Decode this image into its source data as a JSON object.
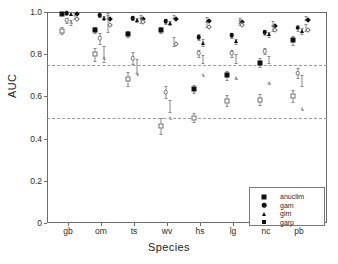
{
  "chart_data": {
    "type": "scatter",
    "title": "",
    "xlabel": "Species",
    "ylabel": "AUC",
    "ylim": [
      0,
      1.0
    ],
    "yticks": [
      "0",
      "0.2",
      "0.4",
      "0.6",
      "0.8",
      "1.0"
    ],
    "ytick_values": [
      0,
      0.2,
      0.4,
      0.6,
      0.8,
      1.0
    ],
    "grid": false,
    "reference_lines": [
      0.75,
      0.5
    ],
    "legend_position": "bottom-right",
    "categories": [
      "gb",
      "om",
      "ts",
      "wv",
      "hs",
      "lg",
      "nc",
      "pb"
    ],
    "series": [
      {
        "name": "anuclim",
        "marker": "square-filled",
        "values": [
          0.99,
          0.915,
          0.895,
          0.915,
          0.635,
          0.7,
          0.76,
          0.865
        ],
        "err_low": [
          0.985,
          0.9,
          0.88,
          0.9,
          0.615,
          0.68,
          0.74,
          0.845
        ],
        "err_high": [
          0.995,
          0.93,
          0.91,
          0.93,
          0.655,
          0.72,
          0.78,
          0.885
        ]
      },
      {
        "name": "gam",
        "marker": "circle-filled",
        "values": [
          0.995,
          0.985,
          0.97,
          0.955,
          0.88,
          0.89,
          0.905,
          0.925
        ],
        "err_low": [
          0.99,
          0.978,
          0.96,
          0.945,
          0.865,
          0.878,
          0.893,
          0.912
        ],
        "err_high": [
          1.0,
          0.992,
          0.98,
          0.965,
          0.895,
          0.902,
          0.917,
          0.938
        ]
      },
      {
        "name": "glm",
        "marker": "triangle-filled",
        "values": [
          0.992,
          0.972,
          0.962,
          0.948,
          0.855,
          0.862,
          0.895,
          0.91
        ],
        "err_low": [
          0.986,
          0.964,
          0.952,
          0.938,
          0.84,
          0.85,
          0.883,
          0.898
        ],
        "err_high": [
          0.998,
          0.98,
          0.972,
          0.958,
          0.87,
          0.874,
          0.907,
          0.922
        ]
      },
      {
        "name": "garp",
        "marker": "diamond-filled",
        "values": [
          0.998,
          0.978,
          0.975,
          0.978,
          0.965,
          0.96,
          0.945,
          0.97
        ],
        "err_low": [
          0.994,
          0.97,
          0.966,
          0.97,
          0.955,
          0.95,
          0.935,
          0.96
        ],
        "err_high": [
          1.0,
          0.986,
          0.984,
          0.986,
          0.975,
          0.97,
          0.955,
          0.98
        ]
      },
      {
        "name": "anuclim-open",
        "marker": "square-open",
        "values": [
          0.912,
          0.8,
          0.682,
          0.46,
          0.5,
          0.58,
          0.585,
          0.6
        ],
        "err_low": [
          0.895,
          0.77,
          0.648,
          0.42,
          0.478,
          0.555,
          0.56,
          0.572
        ],
        "err_high": [
          0.93,
          0.83,
          0.716,
          0.5,
          0.522,
          0.605,
          0.61,
          0.628
        ]
      },
      {
        "name": "gam-open",
        "marker": "circle-open",
        "values": [
          0.96,
          0.875,
          0.782,
          0.62,
          0.805,
          0.805,
          0.815,
          0.71
        ],
        "err_low": [
          0.948,
          0.85,
          0.752,
          0.592,
          0.788,
          0.788,
          0.8,
          0.685
        ],
        "err_high": [
          0.972,
          0.9,
          0.812,
          0.648,
          0.822,
          0.822,
          0.83,
          0.735
        ]
      },
      {
        "name": "glm-open",
        "marker": "triangle-open",
        "values": [
          0.952,
          0.8,
          0.745,
          0.555,
          0.778,
          0.78,
          0.775,
          0.675
        ],
        "err_low": [
          0.94,
          0.762,
          0.712,
          0.525,
          0.76,
          0.76,
          0.758,
          0.65
        ],
        "err_high": [
          0.964,
          0.838,
          0.778,
          0.585,
          0.796,
          0.8,
          0.792,
          0.7
        ]
      },
      {
        "name": "garp-open",
        "marker": "diamond-open",
        "values": [
          0.978,
          0.95,
          0.962,
          0.86,
          0.94,
          0.95,
          0.925,
          0.925
        ],
        "err_low": [
          0.968,
          0.905,
          0.948,
          0.84,
          0.928,
          0.94,
          0.912,
          0.908
        ],
        "err_high": [
          0.988,
          0.995,
          0.976,
          0.88,
          0.952,
          0.96,
          0.938,
          0.942
        ]
      }
    ]
  },
  "legend": {
    "items": [
      {
        "label": "anuclim",
        "marker": "square-filled"
      },
      {
        "label": "gam",
        "marker": "circle-filled"
      },
      {
        "label": "glm",
        "marker": "triangle-filled"
      },
      {
        "label": "garp",
        "marker": "diamond-filled"
      }
    ]
  },
  "colors": {
    "marker_filled": "#111111",
    "marker_open_edge": "#6f6f6f",
    "error_bar": "#8a8a8a",
    "axis": "#6b6b6b",
    "reference_line": "#9a9a9a",
    "background": "#ffffff"
  }
}
